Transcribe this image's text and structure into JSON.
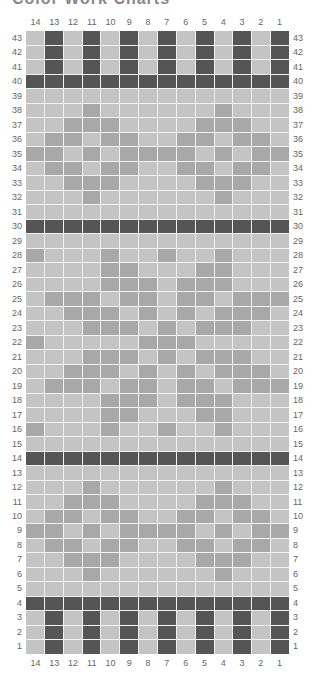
{
  "title": "Color Work Charts",
  "columns": [
    14,
    13,
    12,
    11,
    10,
    9,
    8,
    7,
    6,
    5,
    4,
    3,
    2,
    1
  ],
  "rows_top_to_bottom": [
    43,
    42,
    41,
    40,
    39,
    38,
    37,
    36,
    35,
    34,
    33,
    32,
    31,
    30,
    29,
    28,
    27,
    26,
    25,
    24,
    23,
    22,
    21,
    20,
    19,
    18,
    17,
    16,
    15,
    14,
    13,
    12,
    11,
    10,
    9,
    8,
    7,
    6,
    5,
    4,
    3,
    2,
    1
  ],
  "colors": {
    "background": "#c4c4c4",
    "contrast_light": "#a8a8a8",
    "contrast_dark": "#555555",
    "grid_line": "#f2f2f2"
  },
  "legend": {
    ".": "background",
    "m": "mid-tone contrast",
    "d": "dark contrast"
  },
  "pattern": {
    "43": ".d.d.d.d.d.d.d",
    "42": ".d.d.d.d.d.d.d",
    "41": ".d.d.d.d.d.d.d",
    "40": "dddddddddddddd",
    "39": "..............",
    "38": "...m......m...",
    "37": "..mmm....mmm..",
    "36": ".mm.mm..mm.mm.",
    "35": "mm.m.mmmm.m.mm",
    "34": ".mm.mm..mm.mm.",
    "33": "..mmm....mmm..",
    "32": "...m......m...",
    "31": "..............",
    "30": "dddddddddddddd",
    "29": "..............",
    "28": "m...m..m..m...",
    "27": "....mm...mm...",
    "26": "....mmm.mmm...",
    "25": ".mmm.mm.mm.mmm",
    "24": "..mmm.m.m.mmm.",
    "23": "...mmm.m.mmm..",
    "22": "m.....mmm.....",
    "21": "...mmm.m.mmm..",
    "20": "..mmm.m.m.mmm.",
    "19": ".mmm.mm.mm.mmm",
    "18": "....mmm.mmm...",
    "17": "....mm...mm...",
    "16": "m...m..m..m...",
    "15": "..............",
    "14": "dddddddddddddd",
    "13": "..............",
    "12": "...m......m...",
    "11": "..mmm....mmm..",
    "10": ".mm.mm..mm.mm.",
    "9": "mm.m.mmmm.m.mm",
    "8": ".mm.mm..mm.mm.",
    "7": "..mmm....mmm..",
    "6": "...m......m...",
    "5": "..............",
    "4": "dddddddddddddd",
    "3": ".d.d.d.d.d.d.d",
    "2": ".d.d.d.d.d.d.d",
    "1": ".d.d.d.d.d.d.d"
  }
}
